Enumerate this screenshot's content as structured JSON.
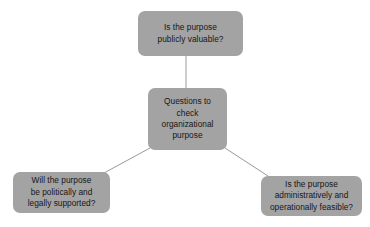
{
  "diagram": {
    "type": "radial-hub-and-spoke",
    "background_color": "#ffffff",
    "node_fill_color": "#a3a3a3",
    "node_text_color": "#161616",
    "connector_color": "#9a9a9a",
    "center": {
      "label": "Questions to\ncheck\norganizational\npurpose"
    },
    "branches": [
      {
        "position": "top",
        "label": "Is the purpose\npublicly valuable?"
      },
      {
        "position": "bottom-left",
        "label": "Will the purpose\nbe politically and\nlegally supported?"
      },
      {
        "position": "bottom-right",
        "label": "Is the purpose\nadministratively and\noperationally feasible?"
      }
    ],
    "connectors": [
      {
        "name": "center-to-top",
        "from": "center",
        "to": "top"
      },
      {
        "name": "center-to-bottom-left",
        "from": "center",
        "to": "bottom-left"
      },
      {
        "name": "center-to-bottom-right",
        "from": "center",
        "to": "bottom-right"
      }
    ]
  }
}
